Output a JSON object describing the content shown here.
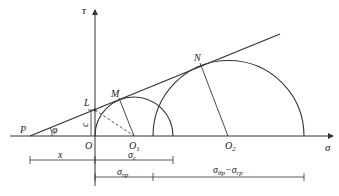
{
  "diagram": {
    "type": "mohr-coulomb-strength-envelope",
    "axes": {
      "vertical": {
        "label": "τ"
      },
      "horizontal": {
        "label": "σ"
      }
    },
    "points": {
      "P": "P",
      "L": "L",
      "M": "M",
      "N": "N",
      "O": "O",
      "O1": {
        "base": "O",
        "sub": "1"
      },
      "O2": {
        "base": "O",
        "sub": "2"
      }
    },
    "angle_label": "φ",
    "cohesion_label": "c",
    "dimensions": {
      "x": "x",
      "sigma_c": {
        "base": "σ",
        "sub": "c"
      },
      "sigma_rp": {
        "base": "σ",
        "sub": "rp"
      },
      "sigma_diff": {
        "base1": "σ",
        "sub1": "θp",
        "sep": "−",
        "base2": "σ",
        "sub2": "rp"
      }
    },
    "colors": {
      "line": "#333333",
      "background": "#ffffff"
    }
  }
}
